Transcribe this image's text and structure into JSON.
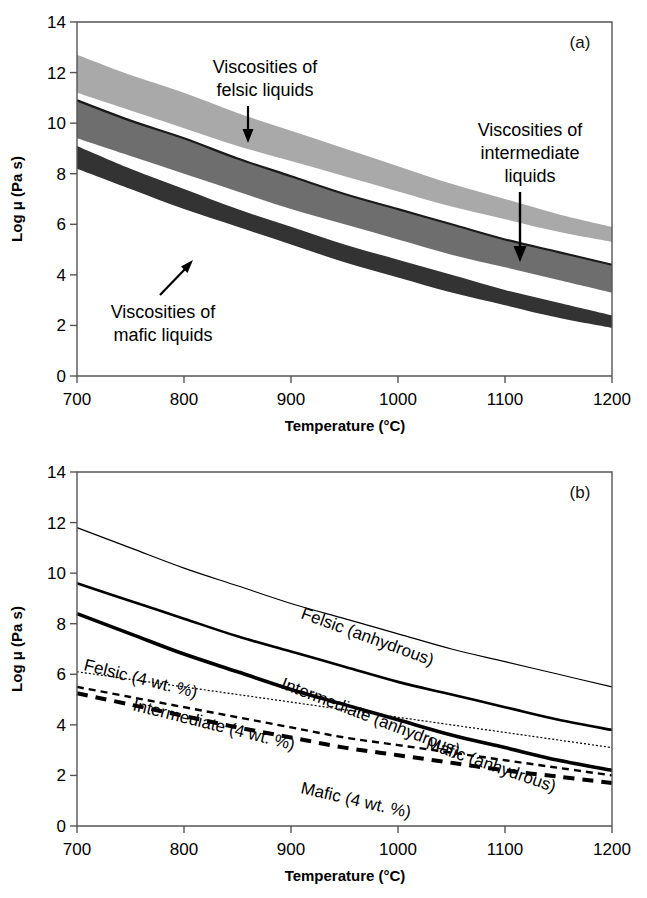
{
  "figure": {
    "panels": [
      {
        "tag": "(a)",
        "xlabel": "Temperature (°C)",
        "ylabel": "Log μ (Pa s)"
      },
      {
        "tag": "(b)",
        "xlabel": "Temperature (°C)",
        "ylabel": "Log μ (Pa s)"
      }
    ]
  },
  "colors": {
    "felsic_band": "#a9a9a9",
    "intermediate_band": "#6e6e6e",
    "mafic_band": "#333333",
    "axis": "#4d4d4d",
    "curve": "#000000",
    "background": "#ffffff"
  },
  "annotations_a": [
    {
      "id": "felsic",
      "lines": [
        "Viscosities of",
        "felsic  liquids"
      ],
      "arrow": "down"
    },
    {
      "id": "intermediate",
      "lines": [
        "Viscosities of",
        "intermediate",
        "liquids"
      ],
      "arrow": "down"
    },
    {
      "id": "mafic",
      "lines": [
        "Viscosities of",
        "mafic  liquids"
      ],
      "arrow": "up-right"
    }
  ],
  "curve_labels_b": [
    {
      "id": "felsic-anhydrous",
      "text": "Felsic (anhydrous)"
    },
    {
      "id": "intermediate-anhydrous",
      "text": "Intermediate (anhydrous)"
    },
    {
      "id": "mafic-anhydrous",
      "text": "Mafic (anhydrous)"
    },
    {
      "id": "felsic-hydrous",
      "text": "Felsic (4 wt. %)"
    },
    {
      "id": "intermediate-hydrous",
      "text": "Intermediate (4 wt. %)"
    },
    {
      "id": "mafic-hydrous",
      "text": "Mafic (4 wt. %)"
    }
  ],
  "chart_data": [
    {
      "type": "area",
      "panel": "a",
      "title": "",
      "xlabel": "Temperature (°C)",
      "ylabel": "Log μ (Pa s)",
      "xlim": [
        700,
        1200
      ],
      "ylim": [
        0,
        14
      ],
      "xticks": [
        700,
        800,
        900,
        1000,
        1100,
        1200
      ],
      "yticks": [
        0,
        2,
        4,
        6,
        8,
        10,
        12,
        14
      ],
      "grid": false,
      "legend": "none",
      "x": [
        700,
        750,
        800,
        850,
        900,
        950,
        1000,
        1050,
        1100,
        1150,
        1200
      ],
      "series": [
        {
          "name": "Viscosities of felsic liquids",
          "kind": "band",
          "color": "#a9a9a9",
          "upper": [
            12.7,
            11.9,
            11.2,
            10.4,
            9.7,
            9.0,
            8.3,
            7.6,
            7.0,
            6.4,
            5.9
          ],
          "lower": [
            11.2,
            10.5,
            9.8,
            9.1,
            8.5,
            7.9,
            7.3,
            6.7,
            6.2,
            5.7,
            5.3
          ]
        },
        {
          "name": "Viscosities of intermediate liquids",
          "kind": "band",
          "color": "#6e6e6e",
          "upper": [
            10.9,
            10.1,
            9.4,
            8.6,
            7.9,
            7.2,
            6.6,
            6.0,
            5.4,
            4.9,
            4.4
          ],
          "lower": [
            9.4,
            8.7,
            8.0,
            7.3,
            6.6,
            6.0,
            5.4,
            4.8,
            4.3,
            3.8,
            3.3
          ]
        },
        {
          "name": "Viscosities of mafic liquids",
          "kind": "band",
          "color": "#333333",
          "upper": [
            9.1,
            8.2,
            7.4,
            6.6,
            5.9,
            5.2,
            4.6,
            4.0,
            3.4,
            2.9,
            2.4
          ],
          "lower": [
            8.2,
            7.4,
            6.6,
            5.9,
            5.2,
            4.5,
            3.9,
            3.3,
            2.8,
            2.3,
            1.9
          ]
        }
      ]
    },
    {
      "type": "line",
      "panel": "b",
      "title": "",
      "xlabel": "Temperature (°C)",
      "ylabel": "Log μ (Pa s)",
      "xlim": [
        700,
        1200
      ],
      "ylim": [
        0,
        14
      ],
      "xticks": [
        700,
        800,
        900,
        1000,
        1100,
        1200
      ],
      "yticks": [
        0,
        2,
        4,
        6,
        8,
        10,
        12,
        14
      ],
      "grid": false,
      "legend": "inline-labels",
      "x": [
        700,
        750,
        800,
        850,
        900,
        950,
        1000,
        1050,
        1100,
        1150,
        1200
      ],
      "series": [
        {
          "name": "Felsic (anhydrous)",
          "style": "thin-solid",
          "values": [
            11.8,
            11.0,
            10.2,
            9.5,
            8.8,
            8.2,
            7.6,
            7.0,
            6.5,
            6.0,
            5.5
          ]
        },
        {
          "name": "Intermediate (anhydrous)",
          "style": "medium-solid",
          "values": [
            9.6,
            8.9,
            8.2,
            7.5,
            6.9,
            6.3,
            5.7,
            5.2,
            4.7,
            4.2,
            3.8
          ]
        },
        {
          "name": "Mafic (anhydrous)",
          "style": "thick-solid",
          "values": [
            8.4,
            7.6,
            6.8,
            6.1,
            5.4,
            4.8,
            4.2,
            3.6,
            3.1,
            2.6,
            2.2
          ]
        },
        {
          "name": "Felsic (4 wt. %)",
          "style": "thin-dotted",
          "values": [
            6.1,
            5.8,
            5.5,
            5.2,
            4.9,
            4.6,
            4.3,
            4.0,
            3.7,
            3.4,
            3.1
          ]
        },
        {
          "name": "Intermediate (4 wt. %)",
          "style": "medium-dashed",
          "values": [
            5.5,
            5.1,
            4.7,
            4.3,
            3.9,
            3.5,
            3.2,
            2.9,
            2.6,
            2.3,
            2.0
          ]
        },
        {
          "name": "Mafic (4 wt. %)",
          "style": "thick-dashed",
          "values": [
            5.25,
            4.8,
            4.35,
            3.9,
            3.5,
            3.1,
            2.8,
            2.5,
            2.2,
            1.95,
            1.7
          ]
        }
      ]
    }
  ]
}
